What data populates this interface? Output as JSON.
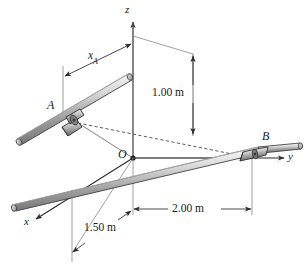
{
  "figure": {
    "background_color": "#ffffff",
    "line_color": "#2b2b2b",
    "rod_fill_light": "#f2f2f2",
    "rod_fill_mid": "#c9c9c9",
    "rod_fill_dark": "#8c8c8c",
    "collar_fill": "#b5b5b5"
  },
  "axes": {
    "z_label": "z",
    "y_label": "y",
    "x_label": "x",
    "origin_label": "O"
  },
  "points": {
    "a_label": "A",
    "b_label": "B"
  },
  "dimensions": [
    {
      "id": "xa",
      "label": "x",
      "sub": "A",
      "full": "xA"
    },
    {
      "id": "h",
      "label": "1.00 m"
    },
    {
      "id": "y",
      "label": "2.00 m"
    },
    {
      "id": "x",
      "label": "1.50 m"
    }
  ],
  "labels": {
    "xa_main": "x",
    "xa_sub": "A",
    "one_meter": "1.00 m",
    "two_meter": "2.00 m",
    "one_half_meter": "1.50 m"
  }
}
